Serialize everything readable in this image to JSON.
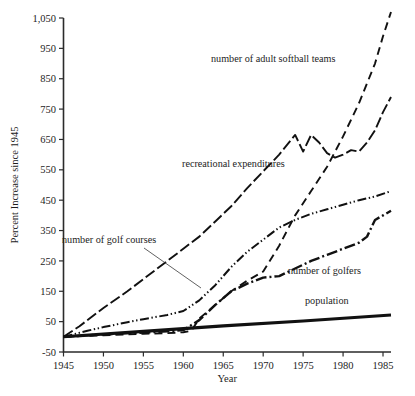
{
  "chart_data": {
    "type": "line",
    "title": "",
    "xlabel": "Year",
    "ylabel": "Percent Increase since 1945",
    "xlim": [
      1945,
      1986
    ],
    "ylim": [
      -50,
      1050
    ],
    "xticks": [
      1945,
      1950,
      1955,
      1960,
      1965,
      1970,
      1975,
      1980,
      1985
    ],
    "xticklabels": [
      "1945",
      "1950",
      "1955",
      "1960",
      "1965",
      "1970",
      "1975",
      "1980",
      "1985"
    ],
    "yticks": [
      -50,
      50,
      150,
      250,
      350,
      450,
      550,
      650,
      750,
      850,
      950,
      1050
    ],
    "yticklabels": [
      "-50",
      "50",
      "150",
      "250",
      "350",
      "450",
      "550",
      "650",
      "750",
      "850",
      "950",
      "1,050"
    ],
    "grid": false,
    "legend_position": "inline-annotations",
    "series": [
      {
        "name": "recreational expenditures",
        "style": "long-dash",
        "x": [
          1945,
          1947,
          1950,
          1953,
          1955,
          1958,
          1960,
          1962,
          1964,
          1966,
          1968,
          1970,
          1972,
          1974,
          1975,
          1976,
          1977,
          1978,
          1979,
          1980,
          1981,
          1982,
          1983,
          1984,
          1985,
          1986
        ],
        "y": [
          0,
          35,
          95,
          150,
          190,
          250,
          290,
          330,
          380,
          430,
          490,
          545,
          600,
          665,
          610,
          665,
          640,
          605,
          590,
          600,
          615,
          610,
          640,
          680,
          740,
          790
        ]
      },
      {
        "name": "number of adult softball teams",
        "style": "dash",
        "x": [
          1945,
          1950,
          1955,
          1958,
          1960,
          1961,
          1962,
          1964,
          1966,
          1968,
          1970,
          1972,
          1974,
          1976,
          1978,
          1980,
          1982,
          1984,
          1985,
          1986
        ],
        "y": [
          0,
          5,
          10,
          12,
          15,
          20,
          60,
          105,
          150,
          185,
          215,
          300,
          400,
          480,
          560,
          660,
          770,
          900,
          990,
          1070
        ]
      },
      {
        "name": "number of golf courses",
        "style": "dash-dot-dot",
        "x": [
          1945,
          1948,
          1950,
          1953,
          1955,
          1958,
          1960,
          1962,
          1964,
          1966,
          1968,
          1970,
          1972,
          1974,
          1976,
          1978,
          1980,
          1982,
          1984,
          1986
        ],
        "y": [
          0,
          20,
          32,
          48,
          58,
          72,
          85,
          120,
          170,
          230,
          280,
          320,
          360,
          385,
          405,
          420,
          435,
          450,
          462,
          480
        ]
      },
      {
        "name": "number of golfers",
        "style": "dash-dot",
        "x": [
          1945,
          1950,
          1955,
          1958,
          1960,
          1962,
          1964,
          1966,
          1968,
          1970,
          1972,
          1974,
          1976,
          1978,
          1980,
          1982,
          1983,
          1984,
          1985,
          1986
        ],
        "y": [
          0,
          8,
          14,
          18,
          22,
          55,
          105,
          150,
          175,
          195,
          200,
          225,
          250,
          270,
          290,
          310,
          330,
          385,
          400,
          415
        ]
      },
      {
        "name": "population",
        "style": "solid-thick",
        "x": [
          1945,
          1955,
          1965,
          1975,
          1986
        ],
        "y": [
          0,
          18,
          36,
          52,
          72
        ]
      }
    ],
    "annotations": [
      {
        "text": "number of adult softball teams",
        "series": "number of adult softball teams"
      },
      {
        "text": "recreational  expenditures",
        "series": "recreational expenditures"
      },
      {
        "text": "number of golf courses",
        "series": "number of golf courses"
      },
      {
        "text": "number of golfers",
        "series": "number of golfers"
      },
      {
        "text": "population",
        "series": "population"
      }
    ]
  },
  "colors": {
    "ink": "#111111",
    "axis": "#2b2b2b",
    "background": "#ffffff"
  }
}
